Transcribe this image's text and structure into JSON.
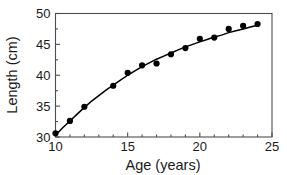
{
  "chart_data": {
    "type": "scatter",
    "title": "",
    "subtitle": "",
    "xlabel": "Age (years)",
    "ylabel": "Length (cm)",
    "xlim": [
      10,
      25
    ],
    "ylim": [
      30,
      50
    ],
    "xticks": [
      10,
      15,
      20,
      25
    ],
    "yticks": [
      30,
      35,
      40,
      45,
      50
    ],
    "xtick_labels": [
      "10",
      "15",
      "20",
      "25"
    ],
    "ytick_labels": [
      "30",
      "35",
      "40",
      "45",
      "50"
    ],
    "x_minor_ticks": [
      11,
      12,
      13,
      14,
      16,
      17,
      18,
      19,
      21,
      22,
      23,
      24
    ],
    "y_minor_ticks": [
      32.5,
      37.5,
      42.5,
      47.5
    ],
    "grid": false,
    "legend": null,
    "legend_position": "none",
    "marker_color": "#000000",
    "curve_color": "#000000",
    "frame_color": "#4d4d4d",
    "background_color": "#ffffff",
    "x": [
      10,
      11,
      12,
      14,
      15,
      16,
      17,
      18,
      19,
      20,
      21,
      22,
      23,
      24
    ],
    "values": [
      30.6,
      32.6,
      34.9,
      38.3,
      40.4,
      41.6,
      41.9,
      43.4,
      44.4,
      45.9,
      46.1,
      47.5,
      48.0,
      48.3
    ],
    "series": [
      {
        "name": "Observed length",
        "type": "scatter",
        "points": [
          {
            "x": 10,
            "y": 30.6
          },
          {
            "x": 11,
            "y": 32.6
          },
          {
            "x": 12,
            "y": 34.9
          },
          {
            "x": 14,
            "y": 38.3
          },
          {
            "x": 15,
            "y": 40.4
          },
          {
            "x": 16,
            "y": 41.6
          },
          {
            "x": 17,
            "y": 41.9
          },
          {
            "x": 18,
            "y": 43.4
          },
          {
            "x": 19,
            "y": 44.4
          },
          {
            "x": 20,
            "y": 45.9
          },
          {
            "x": 21,
            "y": 46.1
          },
          {
            "x": 22,
            "y": 47.5
          },
          {
            "x": 23,
            "y": 48.0
          },
          {
            "x": 24,
            "y": 48.3
          }
        ]
      },
      {
        "name": "Fitted growth curve",
        "type": "line",
        "points": [
          {
            "x": 10.0,
            "y": 30.3
          },
          {
            "x": 10.5,
            "y": 31.5
          },
          {
            "x": 11.0,
            "y": 32.6
          },
          {
            "x": 11.5,
            "y": 33.7
          },
          {
            "x": 12.0,
            "y": 34.8
          },
          {
            "x": 12.5,
            "y": 35.8
          },
          {
            "x": 13.0,
            "y": 36.7
          },
          {
            "x": 13.5,
            "y": 37.6
          },
          {
            "x": 14.0,
            "y": 38.4
          },
          {
            "x": 14.5,
            "y": 39.2
          },
          {
            "x": 15.0,
            "y": 40.0
          },
          {
            "x": 15.5,
            "y": 40.7
          },
          {
            "x": 16.0,
            "y": 41.4
          },
          {
            "x": 16.5,
            "y": 42.0
          },
          {
            "x": 17.0,
            "y": 42.6
          },
          {
            "x": 17.5,
            "y": 43.1
          },
          {
            "x": 18.0,
            "y": 43.6
          },
          {
            "x": 18.5,
            "y": 44.1
          },
          {
            "x": 19.0,
            "y": 44.6
          },
          {
            "x": 19.5,
            "y": 45.0
          },
          {
            "x": 20.0,
            "y": 45.4
          },
          {
            "x": 20.5,
            "y": 45.8
          },
          {
            "x": 21.0,
            "y": 46.2
          },
          {
            "x": 21.5,
            "y": 46.5
          },
          {
            "x": 22.0,
            "y": 46.9
          },
          {
            "x": 22.5,
            "y": 47.2
          },
          {
            "x": 23.0,
            "y": 47.5
          },
          {
            "x": 23.5,
            "y": 47.8
          },
          {
            "x": 24.0,
            "y": 48.1
          }
        ]
      }
    ]
  }
}
